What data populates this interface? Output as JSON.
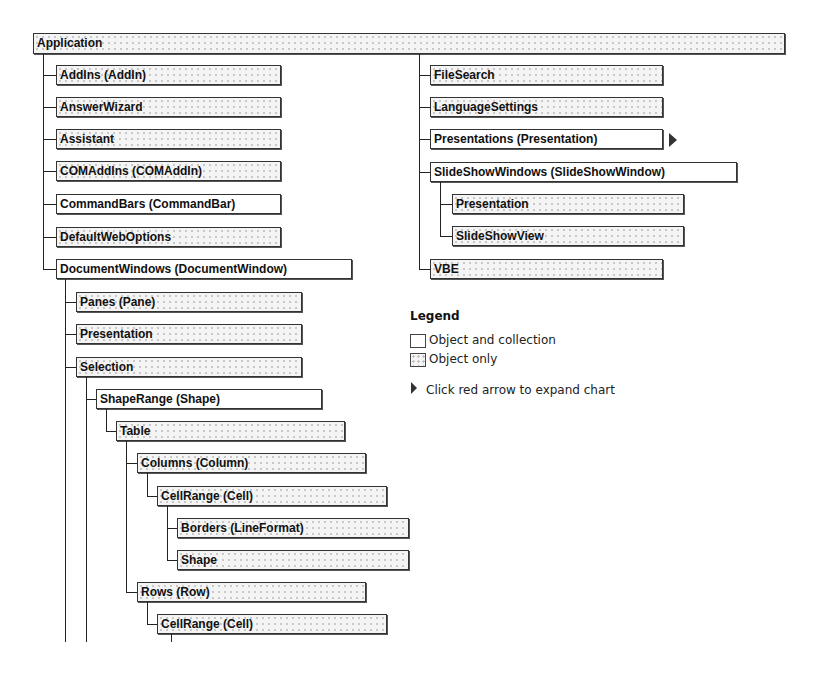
{
  "diagram": {
    "root": "Application",
    "left_column": {
      "items": [
        {
          "label": "AddIns (AddIn)",
          "type": "object-only"
        },
        {
          "label": "AnswerWizard",
          "type": "object-only"
        },
        {
          "label": "Assistant",
          "type": "object-only"
        },
        {
          "label": "COMAddIns (COMAddIn)",
          "type": "object-only"
        },
        {
          "label": "CommandBars (CommandBar)",
          "type": "object-and-collection"
        },
        {
          "label": "DefaultWebOptions",
          "type": "object-only"
        },
        {
          "label": "DocumentWindows (DocumentWindow)",
          "type": "object-and-collection"
        }
      ],
      "document_windows_children": [
        {
          "label": "Panes (Pane)",
          "type": "object-only"
        },
        {
          "label": "Presentation",
          "type": "object-only"
        },
        {
          "label": "Selection",
          "type": "object-only"
        }
      ],
      "selection_children": [
        {
          "label": "ShapeRange (Shape)",
          "type": "object-and-collection"
        }
      ],
      "shape_range_children": [
        {
          "label": "Table",
          "type": "object-only"
        }
      ],
      "table_children": [
        {
          "label": "Columns (Column)",
          "type": "object-only"
        },
        {
          "label": "CellRange (Cell)",
          "type": "object-only"
        },
        {
          "label": "Borders (LineFormat)",
          "type": "object-only"
        },
        {
          "label": "Shape",
          "type": "object-only"
        },
        {
          "label": "Rows (Row)",
          "type": "object-only"
        },
        {
          "label": "CellRange (Cell)",
          "type": "object-only"
        }
      ]
    },
    "right_column": {
      "items": [
        {
          "label": "FileSearch",
          "type": "object-only"
        },
        {
          "label": "LanguageSettings",
          "type": "object-only"
        },
        {
          "label": "Presentations (Presentation)",
          "type": "object-and-collection",
          "expandable": true
        },
        {
          "label": "SlideShowWindows (SlideShowWindow)",
          "type": "object-and-collection"
        },
        {
          "label": "Presentation",
          "type": "object-only"
        },
        {
          "label": "SlideShowView",
          "type": "object-only"
        },
        {
          "label": "VBE",
          "type": "object-only"
        }
      ]
    }
  },
  "legend": {
    "title": "Legend",
    "object_and_collection": "Object and collection",
    "object_only": "Object only",
    "expand_hint": "Click red arrow to expand chart"
  },
  "icons": {
    "expand_arrow": "triangle-right-icon"
  }
}
